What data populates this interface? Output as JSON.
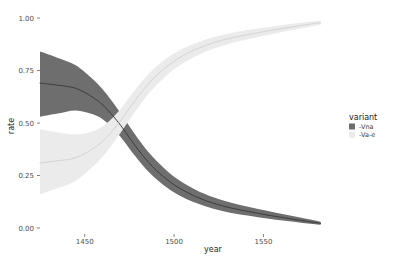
{
  "chart_data": {
    "type": "area",
    "title": "",
    "subtitle": "",
    "xlabel": "year",
    "ylabel": "rate",
    "xlim": [
      1425,
      1585
    ],
    "ylim": [
      0.0,
      1.0
    ],
    "grid": false,
    "legend_position": "right",
    "legend_title": "variant",
    "xticks": [
      1450,
      1500,
      1550
    ],
    "xtick_labels": [
      "1450",
      "1500",
      "1550"
    ],
    "yticks": [
      0.0,
      0.25,
      0.5,
      0.75,
      1.0
    ],
    "ytick_labels": [
      "0.00",
      "0.25",
      "0.50",
      "0.75",
      "1.00"
    ],
    "x": [
      1425,
      1435,
      1445,
      1455,
      1462,
      1470,
      1478,
      1486,
      1494,
      1502,
      1512,
      1522,
      1532,
      1542,
      1552,
      1562,
      1572,
      1582
    ],
    "series": [
      {
        "name": "-Vna",
        "color": "#6e6e6e",
        "band_color": "#6e6e6e",
        "band_opacity": 1.0,
        "line_color": "#3d3d3d",
        "values": [
          0.69,
          0.68,
          0.665,
          0.62,
          0.57,
          0.49,
          0.395,
          0.31,
          0.245,
          0.195,
          0.15,
          0.118,
          0.095,
          0.078,
          0.062,
          0.048,
          0.035,
          0.022
        ],
        "lower": [
          0.53,
          0.545,
          0.56,
          0.54,
          0.505,
          0.435,
          0.345,
          0.265,
          0.205,
          0.16,
          0.12,
          0.092,
          0.072,
          0.058,
          0.045,
          0.034,
          0.024,
          0.015
        ],
        "upper": [
          0.84,
          0.81,
          0.775,
          0.705,
          0.64,
          0.548,
          0.448,
          0.358,
          0.288,
          0.232,
          0.182,
          0.146,
          0.12,
          0.1,
          0.082,
          0.064,
          0.048,
          0.03
        ]
      },
      {
        "name": "-Va-e",
        "color": "#ebebeb",
        "band_color": "#ebebeb",
        "band_opacity": 1.0,
        "line_color": "#d4d4d4",
        "values": [
          0.31,
          0.32,
          0.335,
          0.38,
          0.43,
          0.51,
          0.605,
          0.69,
          0.755,
          0.805,
          0.85,
          0.882,
          0.905,
          0.922,
          0.938,
          0.952,
          0.965,
          0.978
        ],
        "lower": [
          0.16,
          0.19,
          0.225,
          0.295,
          0.36,
          0.452,
          0.552,
          0.642,
          0.712,
          0.768,
          0.818,
          0.854,
          0.88,
          0.9,
          0.918,
          0.936,
          0.952,
          0.968
        ],
        "upper": [
          0.47,
          0.455,
          0.445,
          0.462,
          0.497,
          0.566,
          0.656,
          0.736,
          0.796,
          0.842,
          0.88,
          0.908,
          0.928,
          0.944,
          0.956,
          0.968,
          0.978,
          0.988
        ]
      }
    ]
  }
}
